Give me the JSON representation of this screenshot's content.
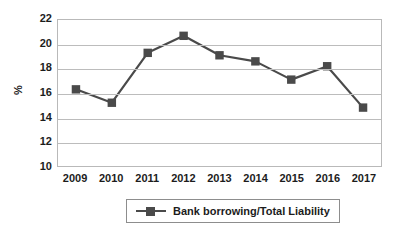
{
  "chart_data": {
    "type": "line",
    "title": "",
    "xlabel": "",
    "ylabel": "%",
    "categories": [
      "2009",
      "2010",
      "2011",
      "2012",
      "2013",
      "2014",
      "2015",
      "2016",
      "2017"
    ],
    "values": [
      16.3,
      15.2,
      19.3,
      20.7,
      19.1,
      18.6,
      17.1,
      18.2,
      14.8
    ],
    "series": [
      {
        "name": "Bank borrowing/Total Liability",
        "values": [
          16.3,
          15.2,
          19.3,
          20.7,
          19.1,
          18.6,
          17.1,
          18.2,
          14.8
        ]
      }
    ],
    "ylim": [
      10,
      22
    ],
    "yticks": [
      10,
      12,
      14,
      16,
      18,
      20,
      22
    ],
    "ytick_labels": [
      "10",
      "12",
      "14",
      "16",
      "18",
      "20",
      "22"
    ],
    "grid": true,
    "grid_axis": "y",
    "legend": {
      "position": "bottom",
      "entries": [
        "Bank borrowing/Total Liability"
      ]
    },
    "marker": "square",
    "series_color": "#4a4a4a",
    "gridline_color": "#bcbcbc",
    "plot_border_color": "#b9b9b9"
  },
  "axes": {
    "y_title": "%"
  }
}
